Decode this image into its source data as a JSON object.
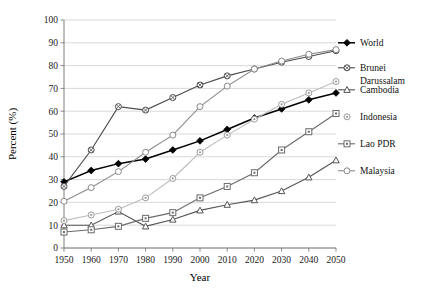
{
  "chart_data": {
    "type": "line",
    "title": "",
    "xlabel": "Year",
    "ylabel": "Percent (%)",
    "xlim": [
      1950,
      2050
    ],
    "ylim": [
      0,
      100
    ],
    "ytick_step": 10,
    "xtick_step": 10,
    "grid": "horizontal",
    "legend_position": "right",
    "x": [
      1950,
      1960,
      1970,
      1980,
      1990,
      2000,
      2010,
      2020,
      2030,
      2040,
      2050
    ],
    "xtick_labels": [
      "1950",
      "1960",
      "1970",
      "1980",
      "1990",
      "2000",
      "2010",
      "2020",
      "2030",
      "2040",
      "2050"
    ],
    "ytick_labels": [
      "0",
      "10",
      "20",
      "30",
      "40",
      "50",
      "60",
      "70",
      "80",
      "90",
      "100"
    ],
    "series": [
      {
        "name": "World",
        "marker": "diamond-filled",
        "color": "#000000",
        "values": [
          29,
          34,
          37,
          39,
          43,
          47,
          52,
          57,
          61,
          65,
          68
        ]
      },
      {
        "name": "Brunei Darussalam",
        "marker": "circle-cross",
        "color": "#4a4a4a",
        "values": [
          27,
          43,
          62,
          60.5,
          66,
          71.5,
          75.5,
          78.5,
          81.5,
          84,
          86.5
        ]
      },
      {
        "name": "Cambodia",
        "marker": "triangle",
        "color": "#555555",
        "values": [
          10,
          10,
          16,
          9.5,
          12.5,
          16.5,
          19,
          21,
          25,
          31,
          38.5
        ]
      },
      {
        "name": "Indonesia",
        "marker": "circle-dot",
        "color": "#bdbdbd",
        "values": [
          12,
          14.5,
          17,
          22,
          30.5,
          42,
          49.5,
          56.5,
          63,
          68,
          73
        ]
      },
      {
        "name": "Lao PDR",
        "marker": "square-dot",
        "color": "#6b6b6b",
        "values": [
          7,
          8,
          9.5,
          13,
          15.5,
          22,
          27,
          33,
          43,
          51,
          59
        ]
      },
      {
        "name": "Malaysia",
        "marker": "circle-open",
        "color": "#8a8a8a",
        "values": [
          20.5,
          26.5,
          33.5,
          42,
          49.5,
          62,
          71,
          78.5,
          82,
          85,
          87
        ]
      }
    ]
  },
  "legend": {
    "items": [
      {
        "label": "World"
      },
      {
        "label": "Brunei"
      },
      {
        "label": "Darussalam"
      },
      {
        "label": "Cambodia"
      },
      {
        "label": "Indonesia"
      },
      {
        "label": "Lao PDR"
      },
      {
        "label": "Malaysia"
      }
    ]
  }
}
